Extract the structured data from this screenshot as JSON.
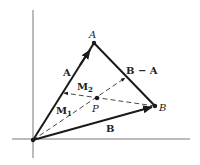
{
  "figure": {
    "points": {
      "O": {
        "x": 33,
        "y": 140
      },
      "A": {
        "x": 94,
        "y": 43,
        "label": "A"
      },
      "B": {
        "x": 155,
        "y": 106,
        "label": "B"
      },
      "P": {
        "x": 97,
        "y": 98,
        "label": "P"
      }
    },
    "vectors": {
      "A": {
        "label": "A"
      },
      "B": {
        "label": "B"
      },
      "BminusA": {
        "label": "B − A"
      },
      "M1": {
        "label": "M",
        "sub": "1"
      },
      "M2": {
        "label": "M",
        "sub": "2"
      }
    },
    "colors": {
      "line": "#1a1a1a",
      "axis": "#555555"
    }
  }
}
